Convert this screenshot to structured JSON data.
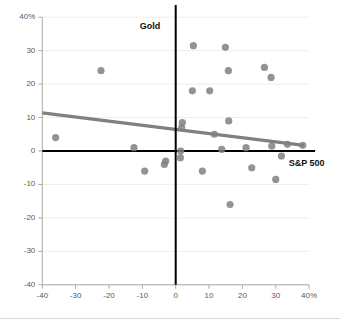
{
  "chart_data": {
    "type": "scatter",
    "title": "",
    "xlabel": "",
    "ylabel": "",
    "xlim": [
      -40,
      40
    ],
    "ylim": [
      -40,
      40
    ],
    "grid": true,
    "grid_axis": "y",
    "legend_position": "inline-annotation",
    "x_tick_labels": [
      "-40",
      "-30",
      "-20",
      "-10",
      "0",
      "10",
      "20",
      "30",
      "40%"
    ],
    "x_ticks": [
      -40,
      -30,
      -20,
      -10,
      0,
      10,
      20,
      30,
      40
    ],
    "y_tick_labels": [
      "40%",
      "30",
      "20",
      "10",
      "0",
      "-10",
      "-20",
      "-30",
      "-40"
    ],
    "y_ticks": [
      40,
      30,
      20,
      10,
      0,
      -10,
      -20,
      -30,
      -40
    ],
    "annotations": [
      {
        "text": "Gold",
        "x": 0,
        "y": 37,
        "anchor": "end",
        "note": "label for vertical zero axis"
      },
      {
        "text": "S&P 500",
        "x": 33,
        "y": -2,
        "anchor": "start",
        "note": "label for horizontal zero axis"
      }
    ],
    "reference_lines": [
      {
        "orientation": "vertical",
        "value": 0,
        "color": "#000000",
        "label": "Gold"
      },
      {
        "orientation": "horizontal",
        "value": 0,
        "color": "#000000",
        "label": "S&P 500"
      }
    ],
    "trendline": {
      "color": "#808080",
      "x_start": -40,
      "y_start": 11.4,
      "x_end": 38.5,
      "y_end": 1.7
    },
    "series": [
      {
        "name": "observations",
        "color": "#808080",
        "marker": "circle",
        "points": [
          {
            "x": -36,
            "y": 4
          },
          {
            "x": -22.4,
            "y": 24
          },
          {
            "x": -12.5,
            "y": 1
          },
          {
            "x": -9.3,
            "y": -6
          },
          {
            "x": -3.4,
            "y": -4
          },
          {
            "x": -3,
            "y": -3
          },
          {
            "x": 1.4,
            "y": -2
          },
          {
            "x": 1.5,
            "y": 0
          },
          {
            "x": 1.8,
            "y": 7
          },
          {
            "x": 2,
            "y": 8.5
          },
          {
            "x": 5,
            "y": 18
          },
          {
            "x": 5.3,
            "y": 31.5
          },
          {
            "x": 8,
            "y": -6
          },
          {
            "x": 10.2,
            "y": 18
          },
          {
            "x": 11.6,
            "y": 5
          },
          {
            "x": 13.8,
            "y": 0.5
          },
          {
            "x": 14.9,
            "y": 31
          },
          {
            "x": 15.8,
            "y": 24
          },
          {
            "x": 15.9,
            "y": 9
          },
          {
            "x": 16.3,
            "y": -16
          },
          {
            "x": 21.1,
            "y": 1
          },
          {
            "x": 22.8,
            "y": -5
          },
          {
            "x": 26.6,
            "y": 25
          },
          {
            "x": 28.6,
            "y": 22
          },
          {
            "x": 28.8,
            "y": 1.5
          },
          {
            "x": 30,
            "y": -8.5
          },
          {
            "x": 31.7,
            "y": -1.5
          },
          {
            "x": 33.5,
            "y": 2
          },
          {
            "x": 38.1,
            "y": 1.7
          }
        ]
      }
    ]
  },
  "colors": {
    "marker": "#808080",
    "trendline": "#808080",
    "axis": "#000000",
    "grid": "#eeeeee",
    "tick_text": "#58585a",
    "frame": "#aaaaaa"
  }
}
